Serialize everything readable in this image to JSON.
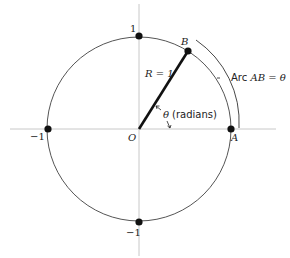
{
  "diagram": {
    "type": "unit-circle-radian",
    "center_label": "O",
    "point_a_label": "A",
    "point_b_label": "B",
    "radius_label": "R = 1",
    "arc_label_prefix": "Arc ",
    "arc_label_math": "AB = θ",
    "angle_symbol": "θ",
    "angle_unit_label": "(radians)",
    "tick_top": "1",
    "tick_bottom": "−1",
    "tick_left": "−1",
    "colors": {
      "axis": "#c8c8c8",
      "circle": "#555555",
      "radius": "#111111",
      "point": "#111111"
    }
  }
}
